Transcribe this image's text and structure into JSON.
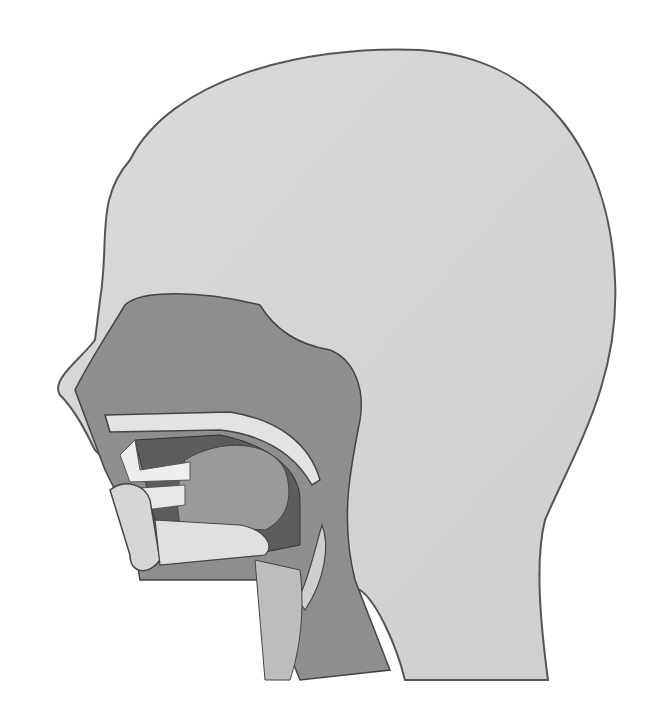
{
  "figure": {
    "colors": {
      "background": "#ffffff",
      "head": "#d4d4d4",
      "outline": "#555555",
      "cavity": "#8a8a8a",
      "bone": "#e2e2e2",
      "dark": "#5c5c5c"
    }
  }
}
